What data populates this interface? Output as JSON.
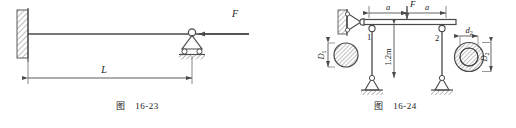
{
  "figures": [
    {
      "id": "fig-16-23",
      "caption_label": "图",
      "caption_number": "16-23",
      "title_type": "cantilever-beam-with-roller-support",
      "labels": {
        "force": "F",
        "length": "L"
      },
      "elements": {
        "fixed_wall": "hatched-fixed-support",
        "beam": "horizontal-beam",
        "roller_support": "pin-and-roller-support",
        "force_arrow_direction": "left",
        "dimension_line": "L"
      },
      "colors": {
        "line": "#4a4a4a",
        "hatch": "#6b6b6b",
        "text": "#1a1a1a"
      }
    },
    {
      "id": "fig-16-24",
      "caption_label": "图",
      "caption_number": "16-24",
      "title_type": "two-bar-structure-with-sections",
      "labels": {
        "force": "F",
        "span_left": "a",
        "span_right": "a",
        "height": "1.2m",
        "member_1": "1",
        "member_2": "2",
        "section_solid_diameter": "D",
        "section_solid_subscript": "1",
        "section_inner_diameter": "d",
        "section_inner_subscript": "2",
        "section_outer_diameter": "D",
        "section_outer_subscript": "2"
      },
      "elements": {
        "wall_pin_support": "hatched-wall-pin-support",
        "beam": "horizontal-rigid-beam",
        "force_arrow_direction": "down",
        "member_1_section": "solid-circle",
        "member_2_section": "annulus",
        "ground_supports": "two-pin-supports-hatched"
      },
      "colors": {
        "line": "#4a4a4a",
        "hatch": "#6b6b6b",
        "text": "#1a1a1a"
      }
    }
  ]
}
